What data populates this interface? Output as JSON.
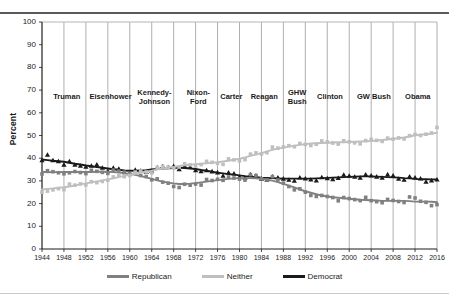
{
  "chart_data": {
    "type": "line",
    "title": "",
    "xlabel": "",
    "ylabel": "Percent",
    "xlim": [
      1944,
      2016
    ],
    "ylim": [
      0,
      100
    ],
    "ytick_step": 10,
    "xtick_step": 4,
    "grid": "vertical-only",
    "legend_position": "bottom",
    "yticks": [
      "0",
      "10",
      "20",
      "30",
      "40",
      "50",
      "60",
      "70",
      "80",
      "90",
      "100"
    ],
    "xticks": [
      "1944",
      "1948",
      "1952",
      "1956",
      "1960",
      "1964",
      "1968",
      "1972",
      "1976",
      "1980",
      "1984",
      "1988",
      "1992",
      "1996",
      "2000",
      "2004",
      "2008",
      "2012",
      "2016"
    ],
    "x": [
      1944,
      1945,
      1946,
      1947,
      1948,
      1949,
      1950,
      1951,
      1952,
      1953,
      1954,
      1955,
      1956,
      1957,
      1958,
      1959,
      1960,
      1961,
      1962,
      1963,
      1964,
      1965,
      1966,
      1967,
      1968,
      1969,
      1970,
      1971,
      1972,
      1973,
      1974,
      1975,
      1976,
      1977,
      1978,
      1979,
      1980,
      1981,
      1982,
      1983,
      1984,
      1985,
      1986,
      1987,
      1988,
      1989,
      1990,
      1991,
      1992,
      1993,
      1994,
      1995,
      1996,
      1997,
      1998,
      1999,
      2000,
      2001,
      2002,
      2003,
      2004,
      2005,
      2006,
      2007,
      2008,
      2009,
      2010,
      2011,
      2012,
      2013,
      2014,
      2015,
      2016
    ],
    "series": [
      {
        "name": "Democrat",
        "color": "#1a1a1a",
        "marker": "triangle",
        "values": [
          40,
          41,
          39,
          39,
          38,
          38,
          37,
          37,
          37,
          36,
          37,
          36,
          35,
          35,
          35,
          34,
          34,
          34,
          34,
          34,
          35,
          35,
          36,
          36,
          37,
          36,
          36,
          36,
          35,
          35,
          34,
          34,
          34,
          33,
          33,
          33,
          32,
          32,
          32,
          32,
          31,
          31,
          31,
          31,
          31,
          31,
          31,
          31,
          31,
          31,
          31,
          31,
          31,
          31,
          32,
          32,
          32,
          32,
          32,
          32,
          32,
          32,
          32,
          32,
          32,
          31,
          31,
          31,
          31,
          31,
          30,
          31,
          30
        ]
      },
      {
        "name": "Republican",
        "color": "#808080",
        "marker": "square",
        "values": [
          34,
          34,
          34,
          34,
          34,
          33,
          34,
          34,
          34,
          34,
          34,
          34,
          34,
          34,
          34,
          34,
          34,
          33,
          32,
          32,
          31,
          30,
          29,
          29,
          28,
          28,
          28,
          28,
          29,
          29,
          30,
          30,
          31,
          31,
          31,
          31,
          31,
          31,
          32,
          32,
          31,
          31,
          31,
          30,
          29,
          28,
          27,
          26,
          25,
          24,
          24,
          23,
          23,
          23,
          22,
          22,
          22,
          22,
          22,
          22,
          21,
          21,
          21,
          21,
          21,
          21,
          21,
          22,
          22,
          21,
          21,
          20,
          19
        ]
      },
      {
        "name": "Neither",
        "color": "#bfbfbf",
        "marker": "square",
        "values": [
          26,
          25,
          26,
          27,
          27,
          28,
          28,
          29,
          29,
          29,
          29,
          30,
          31,
          31,
          32,
          32,
          33,
          33,
          34,
          34,
          34,
          35,
          36,
          36,
          36,
          37,
          37,
          37,
          37,
          38,
          38,
          38,
          38,
          38,
          39,
          39,
          39,
          40,
          41,
          42,
          42,
          43,
          44,
          44,
          45,
          46,
          46,
          46,
          46,
          46,
          47,
          47,
          47,
          47,
          47,
          47,
          47,
          47,
          47,
          47,
          48,
          48,
          48,
          48,
          48,
          49,
          49,
          49,
          50,
          50,
          51,
          52,
          53
        ]
      }
    ],
    "era_annotations": [
      {
        "label": "Truman",
        "start": 1945,
        "end": 1952
      },
      {
        "label": "Eisenhower",
        "start": 1953,
        "end": 1960
      },
      {
        "label": "Kennedy-\nJohnson",
        "start": 1961,
        "end": 1968
      },
      {
        "label": "Nixon-\nFord",
        "start": 1969,
        "end": 1976
      },
      {
        "label": "Carter",
        "start": 1977,
        "end": 1980
      },
      {
        "label": "Reagan",
        "start": 1981,
        "end": 1988
      },
      {
        "label": "GHW\nBush",
        "start": 1989,
        "end": 1992
      },
      {
        "label": "Clinton",
        "start": 1993,
        "end": 2000
      },
      {
        "label": "GW Bush",
        "start": 2001,
        "end": 2008
      },
      {
        "label": "Obama",
        "start": 2009,
        "end": 2016
      }
    ]
  },
  "axis": {
    "ylabel": "Percent"
  },
  "eras": [
    {
      "label_line1": "Truman",
      "label_line2": ""
    },
    {
      "label_line1": "Eisenhower",
      "label_line2": ""
    },
    {
      "label_line1": "Kennedy-",
      "label_line2": "Johnson"
    },
    {
      "label_line1": "Nixon-",
      "label_line2": "Ford"
    },
    {
      "label_line1": "Carter",
      "label_line2": ""
    },
    {
      "label_line1": "Reagan",
      "label_line2": ""
    },
    {
      "label_line1": "GHW",
      "label_line2": "Bush"
    },
    {
      "label_line1": "Clinton",
      "label_line2": ""
    },
    {
      "label_line1": "GW Bush",
      "label_line2": ""
    },
    {
      "label_line1": "Obama",
      "label_line2": ""
    }
  ],
  "legend": {
    "items": [
      {
        "label": "Republican",
        "color": "#808080"
      },
      {
        "label": "Neither",
        "color": "#bfbfbf"
      },
      {
        "label": "Democrat",
        "color": "#1a1a1a"
      }
    ]
  },
  "caption": {
    "ghost_text": ""
  }
}
